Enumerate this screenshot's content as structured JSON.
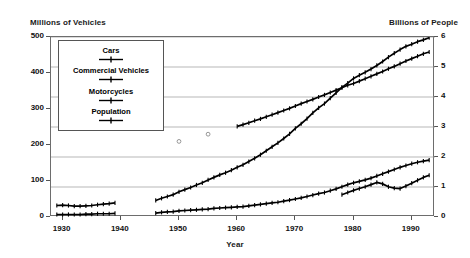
{
  "chart_data": {
    "type": "line",
    "title": "",
    "xlabel": "Year",
    "ylabel_left": "Millions of Vehicles",
    "ylabel_right": "Billions of People",
    "xlim": [
      1928,
      1994
    ],
    "ylim_left": [
      0,
      500
    ],
    "ylim_right": [
      0,
      6
    ],
    "grid": true,
    "legend_position": "upper-left-inside",
    "x_ticks": [
      "1930",
      "1940",
      "1950",
      "1960",
      "1970",
      "1980",
      "1990"
    ],
    "x_tick_values": [
      1930,
      1940,
      1950,
      1960,
      1970,
      1980,
      1990
    ],
    "y_ticks_left": [
      "0",
      "100",
      "200",
      "300",
      "400",
      "500"
    ],
    "y_tick_values_left": [
      0,
      100,
      200,
      300,
      400,
      500
    ],
    "y_ticks_right": [
      "0",
      "1",
      "2",
      "3",
      "4",
      "5",
      "6"
    ],
    "y_tick_values_right": [
      0,
      1,
      2,
      3,
      4,
      5,
      6
    ],
    "series": [
      {
        "name": "Cars",
        "axis": "left",
        "marker": "plus-line",
        "color": "#000000",
        "segments": [
          {
            "x": [
              1929,
              1930,
              1931,
              1932,
              1933,
              1934,
              1935,
              1936,
              1937,
              1938,
              1939
            ],
            "y": [
              32,
              33,
              32,
              30,
              30,
              31,
              32,
              34,
              36,
              37,
              39
            ]
          },
          {
            "x": [
              1946,
              1947,
              1948,
              1949,
              1950,
              1951,
              1952,
              1953,
              1954,
              1955,
              1956,
              1957,
              1958,
              1959,
              1960,
              1961,
              1962,
              1963,
              1964,
              1965,
              1966,
              1967,
              1968,
              1969,
              1970,
              1971,
              1972,
              1973,
              1974,
              1975,
              1976,
              1977,
              1978,
              1979,
              1980,
              1981,
              1982,
              1983,
              1984,
              1985,
              1986,
              1987,
              1988,
              1989,
              1990,
              1991,
              1992,
              1993
            ],
            "y": [
              46,
              52,
              57,
              62,
              70,
              76,
              82,
              89,
              95,
              103,
              110,
              117,
              123,
              130,
              138,
              145,
              154,
              163,
              173,
              184,
              195,
              206,
              218,
              231,
              246,
              259,
              273,
              289,
              303,
              315,
              330,
              345,
              360,
              372,
              385,
              394,
              402,
              411,
              421,
              432,
              444,
              455,
              465,
              474,
              480,
              487,
              492,
              498
            ]
          }
        ]
      },
      {
        "name": "Commercial Vehicles",
        "axis": "left",
        "marker": "plus-line",
        "color": "#000000",
        "segments": [
          {
            "x": [
              1929,
              1930,
              1931,
              1932,
              1933,
              1934,
              1935,
              1936,
              1937,
              1938,
              1939
            ],
            "y": [
              7,
              7,
              7,
              7,
              7,
              8,
              8,
              9,
              9,
              9,
              10
            ]
          },
          {
            "x": [
              1946,
              1947,
              1948,
              1949,
              1950,
              1951,
              1952,
              1953,
              1954,
              1955,
              1956,
              1957,
              1958,
              1959,
              1960,
              1961,
              1962,
              1963,
              1964,
              1965,
              1966,
              1967,
              1968,
              1969,
              1970,
              1971,
              1972,
              1973,
              1974,
              1975,
              1976,
              1977,
              1978,
              1979,
              1980,
              1981,
              1982,
              1983,
              1984,
              1985,
              1986,
              1987,
              1988,
              1989,
              1990,
              1991,
              1992,
              1993
            ],
            "y": [
              11,
              13,
              14,
              15,
              17,
              18,
              19,
              20,
              21,
              22,
              24,
              25,
              26,
              27,
              28,
              29,
              31,
              33,
              35,
              37,
              39,
              41,
              44,
              47,
              50,
              53,
              57,
              61,
              65,
              68,
              73,
              78,
              84,
              90,
              95,
              99,
              103,
              108,
              114,
              120,
              126,
              132,
              138,
              143,
              148,
              152,
              155,
              158
            ]
          }
        ]
      },
      {
        "name": "Motorcycles",
        "axis": "left",
        "marker": "plus-line",
        "color": "#000000",
        "segments": [
          {
            "x": [
              1978,
              1979,
              1980,
              1981,
              1982,
              1983,
              1984,
              1985,
              1986,
              1987,
              1988,
              1989,
              1990,
              1991,
              1992,
              1993
            ],
            "y": [
              62,
              68,
              74,
              79,
              84,
              90,
              96,
              92,
              84,
              80,
              79,
              86,
              94,
              102,
              110,
              116
            ]
          }
        ]
      },
      {
        "name": "Population",
        "axis": "right",
        "marker": "plus-line",
        "color": "#000000",
        "segments": [
          {
            "x": [
              1960,
              1961,
              1962,
              1963,
              1964,
              1965,
              1966,
              1967,
              1968,
              1969,
              1970,
              1971,
              1972,
              1973,
              1974,
              1975,
              1976,
              1977,
              1978,
              1979,
              1980,
              1981,
              1982,
              1983,
              1984,
              1985,
              1986,
              1987,
              1988,
              1989,
              1990,
              1991,
              1992,
              1993
            ],
            "y": [
              3.02,
              3.08,
              3.14,
              3.21,
              3.27,
              3.34,
              3.41,
              3.48,
              3.55,
              3.62,
              3.7,
              3.78,
              3.85,
              3.92,
              4.0,
              4.07,
              4.15,
              4.23,
              4.31,
              4.39,
              4.45,
              4.53,
              4.61,
              4.69,
              4.77,
              4.85,
              4.94,
              5.02,
              5.11,
              5.2,
              5.28,
              5.36,
              5.44,
              5.5
            ]
          }
        ],
        "isolated_points": [
          {
            "x": 1950,
            "y": 2.52
          },
          {
            "x": 1955,
            "y": 2.76
          }
        ]
      }
    ]
  },
  "legend": {
    "items": [
      {
        "label": "Cars"
      },
      {
        "label": "Commercial Vehicles"
      },
      {
        "label": "Motorcycles"
      },
      {
        "label": "Population"
      }
    ]
  }
}
